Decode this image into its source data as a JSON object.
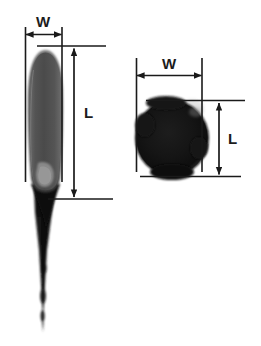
{
  "figure": {
    "title": "",
    "background_color": "#ffffff",
    "line_color": "#1a1a1a",
    "panels": [
      {
        "id": "damaged-cell-comet",
        "name": "comet-shape-panel",
        "shape": "comet",
        "shape_description": "elongated teardrop nucleus with long trailing tail",
        "body_color": "#4a4a4a",
        "tail_color": "#111111",
        "highlight_color": "#8c8c8c",
        "measurements": [
          {
            "symbol": "W",
            "axis": "horizontal",
            "name": "width"
          },
          {
            "symbol": "L",
            "axis": "vertical",
            "name": "length"
          }
        ]
      },
      {
        "id": "undamaged-cell-round",
        "name": "round-shape-panel",
        "shape": "circle",
        "shape_description": "round compact nucleus without tail",
        "body_color": "#111111",
        "tail_color": "#111111",
        "highlight_color": "#d8d8d8",
        "measurements": [
          {
            "symbol": "W",
            "axis": "horizontal",
            "name": "width"
          },
          {
            "symbol": "L",
            "axis": "vertical",
            "name": "length"
          }
        ]
      }
    ]
  },
  "labels": {
    "left_width": "W",
    "left_length": "L",
    "right_width": "W",
    "right_length": "L"
  }
}
